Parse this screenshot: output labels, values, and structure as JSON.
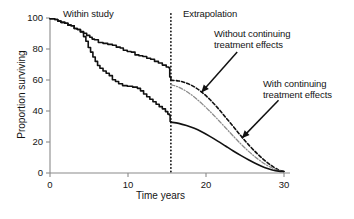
{
  "chart_data": {
    "type": "line",
    "title": "",
    "xlabel": "Time years",
    "ylabel": "Proportion surviving",
    "xlim": [
      0,
      30
    ],
    "ylim": [
      0,
      100
    ],
    "xticks": [
      0,
      10,
      20,
      30
    ],
    "xtick_labels": [
      "0",
      "10",
      "20",
      "30"
    ],
    "yticks": [
      0,
      20,
      40,
      60,
      80,
      100
    ],
    "ytick_labels": [
      "0",
      "20",
      "40",
      "60",
      "80",
      "100"
    ],
    "grid": false,
    "legend_position": "none",
    "annotations": [
      {
        "id": "within-study",
        "text": "Within study",
        "x": 4.2,
        "y": 101
      },
      {
        "id": "extrapolation",
        "text": "Extrapolation",
        "x": 18.6,
        "y": 101
      },
      {
        "id": "without-continuing",
        "line1": "Without continuing",
        "line2": "treatment effects",
        "x": 22.5,
        "y": 88
      },
      {
        "id": "with-continuing",
        "line1": "With continuing",
        "line2": "treatment effects",
        "x": 28.5,
        "y": 56
      }
    ],
    "cutoff": {
      "label": "study-end",
      "x": 15.5,
      "style": "dotted-vertical"
    },
    "series": [
      {
        "name": "upper-study-arm",
        "style": "solid",
        "color": "#111111",
        "segment": "within-study",
        "points": [
          [
            0,
            99.5
          ],
          [
            0.6,
            99.0
          ],
          [
            1.0,
            98.0
          ],
          [
            1.4,
            97.2
          ],
          [
            1.9,
            96.6
          ],
          [
            2.3,
            95.4
          ],
          [
            2.7,
            95.0
          ],
          [
            3.1,
            93.2
          ],
          [
            3.5,
            92.6
          ],
          [
            3.9,
            91.2
          ],
          [
            4.3,
            90.2
          ],
          [
            4.7,
            88.8
          ],
          [
            5.1,
            87.6
          ],
          [
            5.4,
            86.4
          ],
          [
            5.7,
            86.0
          ],
          [
            6.2,
            84.2
          ],
          [
            6.8,
            83.6
          ],
          [
            7.4,
            83.0
          ],
          [
            8.0,
            82.4
          ],
          [
            8.5,
            81.2
          ],
          [
            9.0,
            80.6
          ],
          [
            9.4,
            79.2
          ],
          [
            9.9,
            78.4
          ],
          [
            10.4,
            78.0
          ],
          [
            10.9,
            76.2
          ],
          [
            11.4,
            75.6
          ],
          [
            11.9,
            75.2
          ],
          [
            12.4,
            74.0
          ],
          [
            12.9,
            73.4
          ],
          [
            13.4,
            72.0
          ],
          [
            13.9,
            71.0
          ],
          [
            14.4,
            69.6
          ],
          [
            14.9,
            68.4
          ],
          [
            15.2,
            68.0
          ],
          [
            15.35,
            62.0
          ],
          [
            15.5,
            59.8
          ]
        ]
      },
      {
        "name": "lower-study-arm",
        "style": "solid",
        "color": "#111111",
        "segment": "within-study",
        "points": [
          [
            0,
            99.5
          ],
          [
            0.6,
            99.0
          ],
          [
            1.0,
            98.0
          ],
          [
            1.4,
            97.2
          ],
          [
            1.9,
            96.6
          ],
          [
            2.3,
            95.4
          ],
          [
            2.7,
            95.0
          ],
          [
            3.1,
            93.2
          ],
          [
            3.5,
            92.6
          ],
          [
            3.9,
            91.0
          ],
          [
            4.3,
            88.0
          ],
          [
            4.6,
            85.0
          ],
          [
            4.9,
            81.0
          ],
          [
            5.2,
            78.0
          ],
          [
            5.5,
            74.8
          ],
          [
            5.8,
            72.0
          ],
          [
            6.1,
            69.4
          ],
          [
            6.4,
            67.6
          ],
          [
            6.8,
            65.8
          ],
          [
            7.2,
            64.4
          ],
          [
            7.6,
            62.8
          ],
          [
            8.0,
            60.2
          ],
          [
            8.4,
            59.0
          ],
          [
            8.8,
            57.6
          ],
          [
            9.3,
            56.4
          ],
          [
            9.9,
            56.0
          ],
          [
            10.6,
            55.4
          ],
          [
            11.2,
            54.6
          ],
          [
            11.6,
            53.0
          ],
          [
            12.0,
            51.0
          ],
          [
            12.4,
            49.2
          ],
          [
            12.8,
            47.6
          ],
          [
            13.2,
            46.0
          ],
          [
            13.6,
            44.4
          ],
          [
            14.0,
            42.8
          ],
          [
            14.4,
            41.4
          ],
          [
            14.8,
            39.6
          ],
          [
            15.1,
            38.0
          ],
          [
            15.3,
            37.4
          ],
          [
            15.4,
            33.2
          ],
          [
            15.5,
            32.8
          ]
        ]
      },
      {
        "name": "without-continuing-treatment-effects",
        "style": "dashed",
        "color": "#111111",
        "segment": "extrapolation",
        "points": [
          [
            15.5,
            59.8
          ],
          [
            16.5,
            59.4
          ],
          [
            17.5,
            58.0
          ],
          [
            18.5,
            55.6
          ],
          [
            19.5,
            52.0
          ],
          [
            20.5,
            47.4
          ],
          [
            21.5,
            42.0
          ],
          [
            22.5,
            36.0
          ],
          [
            23.5,
            30.0
          ],
          [
            24.5,
            23.8
          ],
          [
            25.5,
            18.0
          ],
          [
            26.5,
            12.8
          ],
          [
            27.5,
            8.2
          ],
          [
            28.5,
            4.4
          ],
          [
            29.3,
            2.0
          ],
          [
            30,
            1.0
          ]
        ]
      },
      {
        "name": "intermediate-extrapolation",
        "style": "dash-dot",
        "color": "#8c8c8c",
        "segment": "extrapolation",
        "points": [
          [
            15.5,
            57.0
          ],
          [
            16.5,
            55.4
          ],
          [
            17.5,
            52.6
          ],
          [
            18.5,
            49.0
          ],
          [
            19.5,
            44.6
          ],
          [
            20.5,
            39.8
          ],
          [
            21.5,
            34.6
          ],
          [
            22.5,
            29.2
          ],
          [
            23.5,
            23.8
          ],
          [
            24.5,
            18.6
          ],
          [
            25.5,
            13.8
          ],
          [
            26.5,
            9.6
          ],
          [
            27.5,
            6.0
          ],
          [
            28.5,
            3.2
          ],
          [
            29.3,
            1.6
          ],
          [
            30,
            1.0
          ]
        ]
      },
      {
        "name": "with-continuing-treatment-effects",
        "style": "solid",
        "color": "#111111",
        "segment": "extrapolation",
        "points": [
          [
            15.5,
            32.8
          ],
          [
            16.5,
            32.0
          ],
          [
            17.5,
            30.6
          ],
          [
            18.5,
            28.8
          ],
          [
            19.5,
            26.4
          ],
          [
            20.5,
            23.6
          ],
          [
            21.5,
            20.6
          ],
          [
            22.5,
            17.4
          ],
          [
            23.5,
            14.2
          ],
          [
            24.5,
            11.2
          ],
          [
            25.5,
            8.4
          ],
          [
            26.5,
            5.8
          ],
          [
            27.5,
            3.6
          ],
          [
            28.5,
            2.0
          ],
          [
            29.3,
            1.2
          ],
          [
            30,
            1.0
          ]
        ]
      }
    ],
    "arrows": [
      {
        "id": "arrow-without",
        "from": [
          24.0,
          78.0
        ],
        "to": [
          19.4,
          52.0
        ]
      },
      {
        "id": "arrow-with",
        "from": [
          29.3,
          47.0
        ],
        "to": [
          24.6,
          22.5
        ]
      }
    ]
  },
  "axis": {
    "x_title": "Time years",
    "y_title": "Proportion surviving"
  },
  "colors": {
    "axis": "#8a8a8a",
    "curve": "#111111",
    "intermediate_curve": "#8c8c8c",
    "text": "#141414",
    "background": "#ffffff"
  }
}
